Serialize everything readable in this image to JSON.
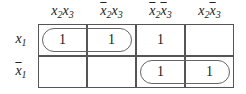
{
  "kmap": {
    "columns": [
      {
        "var1": "x",
        "sub1": "2",
        "bar1": false,
        "var2": "x",
        "sub2": "3",
        "bar2": false
      },
      {
        "var1": "x",
        "sub1": "2",
        "bar1": true,
        "var2": "x",
        "sub2": "3",
        "bar2": false
      },
      {
        "var1": "x",
        "sub1": "2",
        "bar1": true,
        "var2": "x",
        "sub2": "3",
        "bar2": true
      },
      {
        "var1": "x",
        "sub1": "2",
        "bar1": false,
        "var2": "x",
        "sub2": "3",
        "bar2": true
      }
    ],
    "rows": [
      {
        "var": "x",
        "sub": "1",
        "bar": false
      },
      {
        "var": "x",
        "sub": "1",
        "bar": true
      }
    ],
    "cells": [
      [
        "1",
        "1",
        "1",
        ""
      ],
      [
        "",
        "",
        "1",
        "1"
      ]
    ],
    "groups": [
      {
        "row": 0,
        "col_start": 0,
        "col_end": 1
      },
      {
        "row": 1,
        "col_start": 2,
        "col_end": 3
      }
    ]
  }
}
